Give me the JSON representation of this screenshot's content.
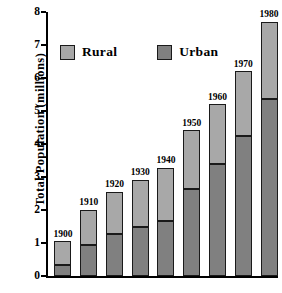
{
  "chart_data": {
    "type": "bar",
    "subtype": "stacked-vertical",
    "title": "",
    "xlabel": "",
    "ylabel": "Total Population (millions)",
    "ylim": [
      0,
      8
    ],
    "yticks": [
      "0",
      "1",
      "2",
      "3",
      "4",
      "5",
      "6",
      "7",
      "8"
    ],
    "grid": false,
    "legend_position": "upper-left-inside",
    "categories": [
      "1900",
      "1910",
      "1920",
      "1930",
      "1940",
      "1950",
      "1960",
      "1970",
      "1980"
    ],
    "series": [
      {
        "name": "Urban",
        "color": "#808080",
        "values": [
          0.33,
          0.93,
          1.26,
          1.5,
          1.68,
          2.65,
          3.4,
          4.24,
          5.35
        ]
      },
      {
        "name": "Rural",
        "color": "#a8a8a8",
        "values": [
          0.72,
          1.08,
          1.3,
          1.42,
          1.6,
          1.77,
          1.8,
          1.96,
          2.35
        ]
      }
    ],
    "totals": [
      1.05,
      2.01,
      2.56,
      2.92,
      3.28,
      4.42,
      5.2,
      6.2,
      7.7
    ],
    "bar_labels": [
      "1900",
      "1910",
      "1920",
      "1930",
      "1940",
      "1950",
      "1960",
      "1970",
      "1980"
    ]
  },
  "legend": {
    "items": [
      {
        "label": "Rural",
        "color": "#a8a8a8",
        "swatch_name": "legend-swatch-rural"
      },
      {
        "label": "Urban",
        "color": "#808080",
        "swatch_name": "legend-swatch-urban"
      }
    ]
  },
  "colors": {
    "rural": "#a8a8a8",
    "urban": "#808080",
    "outline": "#1a1a1a",
    "axis": "#000000",
    "background": "#ffffff"
  }
}
